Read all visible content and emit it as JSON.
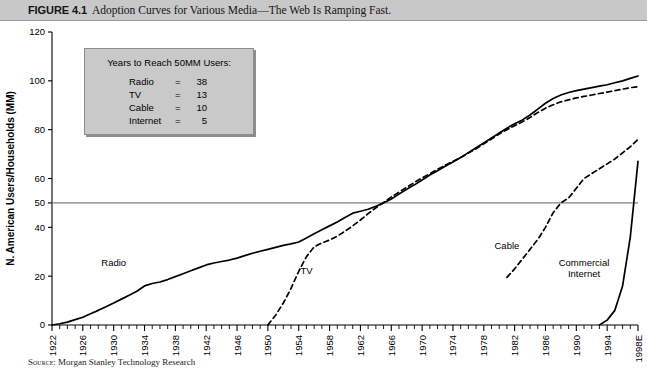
{
  "caption": {
    "figure_number": "FIGURE 4.1",
    "text": "Adoption Curves for Various Media—The Web Is Ramping Fast."
  },
  "source_note": {
    "label": "Source:",
    "text": "Morgan Stanley Technology Research"
  },
  "legend": {
    "title": "Years to Reach 50MM Users:",
    "rows": [
      {
        "name": "Radio",
        "eq": "=",
        "value": "38"
      },
      {
        "name": "TV",
        "eq": "=",
        "value": "13"
      },
      {
        "name": "Cable",
        "eq": "=",
        "value": "10"
      },
      {
        "name": "Internet",
        "eq": "=",
        "value": "5"
      }
    ]
  },
  "chart_data": {
    "type": "line",
    "title": "Adoption Curves for Various Media—The Web Is Ramping Fast.",
    "xlabel": "",
    "ylabel": "N. American Users/Households (MM)",
    "xlim": [
      1922,
      1998
    ],
    "ylim": [
      0,
      120
    ],
    "yticks": [
      0,
      20,
      40,
      50,
      60,
      80,
      100,
      120
    ],
    "xticks": [
      1922,
      1926,
      1930,
      1934,
      1938,
      1942,
      1946,
      1950,
      1954,
      1958,
      1962,
      1966,
      1970,
      1974,
      1978,
      1982,
      1986,
      1990,
      1994,
      1998
    ],
    "xtick_labels": [
      "1922",
      "1926",
      "1930",
      "1934",
      "1938",
      "1942",
      "1946",
      "1950",
      "1954",
      "1958",
      "1962",
      "1966",
      "1970",
      "1974",
      "1978",
      "1982",
      "1986",
      "1990",
      "1994",
      "1998E"
    ],
    "minor_tick_interval": 1,
    "grid": false,
    "legend_position": "none",
    "reference_lines": [
      {
        "name": "50mm-users-line",
        "axis": "y",
        "value": 50,
        "color": "#808080"
      }
    ],
    "annotations": [
      {
        "name": "Radio",
        "x": 1930,
        "y": 24
      },
      {
        "name": "TV",
        "x": 1955,
        "y": 21
      },
      {
        "name": "Cable",
        "x": 1981,
        "y": 31
      },
      {
        "name": "Commercial Internet",
        "x": 1991,
        "y": 24
      }
    ],
    "series": [
      {
        "name": "Radio",
        "style": "solid",
        "color": "#000000",
        "x": [
          1922,
          1923,
          1924,
          1925,
          1926,
          1927,
          1928,
          1929,
          1930,
          1931,
          1932,
          1933,
          1934,
          1935,
          1936,
          1937,
          1938,
          1939,
          1940,
          1941,
          1942,
          1943,
          1944,
          1945,
          1946,
          1947,
          1948,
          1949,
          1950,
          1951,
          1952,
          1953,
          1954,
          1955,
          1956,
          1957,
          1958,
          1959,
          1960,
          1961,
          1962,
          1963,
          1964,
          1965,
          1966,
          1967,
          1968,
          1969,
          1970,
          1971,
          1972,
          1973,
          1974,
          1975,
          1976,
          1977,
          1978,
          1979,
          1980,
          1981,
          1982,
          1983,
          1984,
          1985,
          1986,
          1987,
          1988,
          1989,
          1990,
          1991,
          1992,
          1993,
          1994,
          1995,
          1996,
          1997,
          1998
        ],
        "y": [
          0,
          0.5,
          1.2,
          2.2,
          3.2,
          4.6,
          6.0,
          7.5,
          9.0,
          10.6,
          12.2,
          13.8,
          16.0,
          17.0,
          17.6,
          18.6,
          19.8,
          21.0,
          22.2,
          23.4,
          24.6,
          25.4,
          26.0,
          26.6,
          27.4,
          28.4,
          29.4,
          30.2,
          31.0,
          31.8,
          32.6,
          33.2,
          34.0,
          35.6,
          37.4,
          39.0,
          40.6,
          42.2,
          44.0,
          45.8,
          46.6,
          47.4,
          48.6,
          50.0,
          51.6,
          53.6,
          55.6,
          57.4,
          59.4,
          61.4,
          63.2,
          65.0,
          66.8,
          68.6,
          70.6,
          72.6,
          74.6,
          76.6,
          78.6,
          80.6,
          82.4,
          84.0,
          86.0,
          88.4,
          90.8,
          92.8,
          94.2,
          95.2,
          96.0,
          96.6,
          97.2,
          97.8,
          98.4,
          99.2,
          100.0,
          101.0,
          102.0
        ]
      },
      {
        "name": "TV",
        "style": "dashed",
        "color": "#000000",
        "x": [
          1950,
          1951,
          1952,
          1953,
          1954,
          1955,
          1956,
          1957,
          1958,
          1959,
          1960,
          1961,
          1962,
          1963,
          1964,
          1965,
          1966,
          1967,
          1968,
          1969,
          1970,
          1971,
          1972,
          1973,
          1974,
          1975,
          1976,
          1977,
          1978,
          1979,
          1980,
          1981,
          1982,
          1983,
          1984,
          1985,
          1986,
          1987,
          1988,
          1989,
          1990,
          1991,
          1992,
          1993,
          1994,
          1995,
          1996,
          1997,
          1998
        ],
        "y": [
          0,
          4.0,
          9.0,
          15.0,
          22.0,
          28.0,
          32.0,
          33.6,
          34.8,
          36.4,
          38.4,
          40.6,
          43.0,
          45.6,
          48.0,
          50.2,
          52.4,
          54.4,
          56.4,
          58.4,
          60.2,
          62.0,
          63.8,
          65.4,
          67.0,
          68.6,
          70.4,
          72.2,
          74.2,
          76.2,
          78.2,
          80.0,
          81.6,
          83.2,
          85.0,
          87.0,
          88.8,
          90.2,
          91.4,
          92.2,
          93.0,
          93.6,
          94.2,
          94.8,
          95.4,
          96.0,
          96.6,
          97.2,
          97.6
        ]
      },
      {
        "name": "Cable",
        "style": "dashed",
        "color": "#000000",
        "x": [
          1981,
          1982,
          1983,
          1984,
          1985,
          1986,
          1987,
          1988,
          1989,
          1990,
          1991,
          1992,
          1993,
          1994,
          1995,
          1996,
          1997,
          1998
        ],
        "y": [
          19.5,
          23.0,
          27.0,
          31.0,
          35.0,
          40.0,
          46.0,
          50.0,
          52.0,
          56.0,
          60.0,
          62.0,
          64.0,
          66.0,
          68.0,
          70.5,
          73.0,
          76.0
        ]
      },
      {
        "name": "Commercial Internet",
        "style": "solid",
        "color": "#000000",
        "x": [
          1993,
          1994,
          1995,
          1996,
          1997,
          1998
        ],
        "y": [
          0,
          2.0,
          6.0,
          16.0,
          36.0,
          67.0
        ]
      }
    ]
  }
}
